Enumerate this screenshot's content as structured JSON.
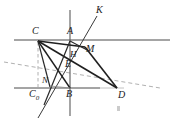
{
  "figure": {
    "type": "geometry-diagram",
    "width": 174,
    "height": 130,
    "background": "#ffffff",
    "stroke_color": "#2b2b2b",
    "light_stroke_color": "#9a9a9a",
    "dashed_stroke_color": "#8c8c8c"
  },
  "labels": {
    "C": "C",
    "A": "A",
    "K": "K",
    "M": "M",
    "H": "H",
    "E": "E",
    "N": "N",
    "C0_main": "C",
    "C0_sub": "0",
    "B": "B",
    "D": "D"
  },
  "points": {
    "C": {
      "x": 38,
      "y": 40
    },
    "A": {
      "x": 70,
      "y": 40
    },
    "K": {
      "x": 97,
      "y": 16
    },
    "M": {
      "x": 84,
      "y": 47
    },
    "H": {
      "x": 72,
      "y": 55
    },
    "E": {
      "x": 70,
      "y": 66
    },
    "N": {
      "x": 49,
      "y": 86
    },
    "C0": {
      "x": 38,
      "y": 88
    },
    "B": {
      "x": 70,
      "y": 88
    },
    "D": {
      "x": 117,
      "y": 88
    }
  },
  "label_positions": {
    "C": {
      "x": 32,
      "y": 26
    },
    "A": {
      "x": 68,
      "y": 26
    },
    "K": {
      "x": 96,
      "y": 7
    },
    "M": {
      "x": 85,
      "y": 44
    },
    "H": {
      "x": 70,
      "y": 50
    },
    "E": {
      "x": 66,
      "y": 60
    },
    "N": {
      "x": 42,
      "y": 76
    },
    "C0": {
      "x": 30,
      "y": 89
    },
    "B": {
      "x": 66,
      "y": 89
    },
    "D": {
      "x": 118,
      "y": 90
    }
  },
  "lines": {
    "top_horizontal": {
      "x1": 14,
      "y1": 40,
      "x2": 170,
      "y2": 40
    },
    "bottom_horizontal": {
      "x1": 14,
      "y1": 88,
      "x2": 100,
      "y2": 88
    },
    "bottom_horizontal_faint": {
      "x1": 100,
      "y1": 88,
      "x2": 122,
      "y2": 88
    },
    "vertical": {
      "x1": 70,
      "y1": 10,
      "x2": 70,
      "y2": 116
    },
    "ray_NK": {
      "x1": 38,
      "y1": 118,
      "x2": 97,
      "y2": 16
    },
    "seg_C_D": {
      "x1": 38,
      "y1": 41,
      "x2": 117,
      "y2": 88
    },
    "seg_C_M_D": {
      "x1": 38,
      "y1": 41,
      "x2": 84,
      "y2": 47
    },
    "seg_M_D": {
      "x1": 84,
      "y1": 47,
      "x2": 117,
      "y2": 88
    },
    "seg_C_B": {
      "x1": 38,
      "y1": 41,
      "x2": 70,
      "y2": 88
    },
    "seg_C_N": {
      "x1": 38,
      "y1": 41,
      "x2": 49,
      "y2": 86
    },
    "seg_A_Nlow": {
      "x1": 70,
      "y1": 41,
      "x2": 45,
      "y2": 104
    },
    "seg_A_M": {
      "x1": 70,
      "y1": 41,
      "x2": 88,
      "y2": 50
    },
    "seg_dashed_C_C0": {
      "x1": 38,
      "y1": 42,
      "x2": 38,
      "y2": 87
    },
    "seg_dashed_long": {
      "x1": 4,
      "y1": 62,
      "x2": 160,
      "y2": 88
    },
    "seg_N_B": {
      "x1": 49,
      "y1": 86,
      "x2": 70,
      "y2": 88
    }
  },
  "artifact": {
    "x": 117,
    "y": 106,
    "note": "faint speck"
  }
}
